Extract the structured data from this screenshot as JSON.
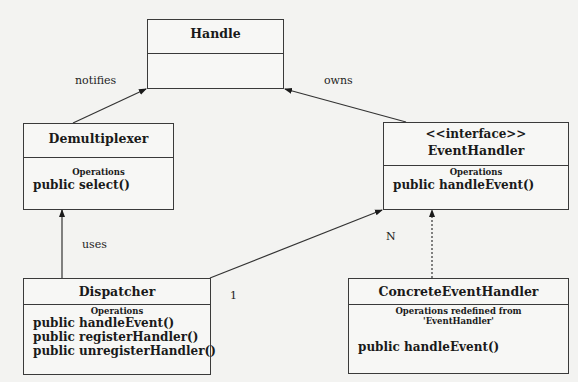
{
  "diagram": {
    "type": "UML class diagram",
    "classes": {
      "handle": {
        "name": "Handle"
      },
      "demultiplexer": {
        "name": "Demultiplexer",
        "ops_header": "Operations",
        "operations": [
          "public select()"
        ]
      },
      "event_handler": {
        "stereotype": "<<interface>>",
        "name": "EventHandler",
        "ops_header": "Operations",
        "operations": [
          "public handleEvent()"
        ]
      },
      "dispatcher": {
        "name": "Dispatcher",
        "ops_header": "Operations",
        "operations": [
          "public handleEvent()",
          "public registerHandler()",
          "public unregisterHandler()"
        ]
      },
      "concrete_event_handler": {
        "name": "ConcreteEventHandler",
        "ops_header_line1": "Operations redefined from",
        "ops_header_line2": "'EventHandler'",
        "operations": [
          "public handleEvent()"
        ]
      }
    },
    "relationships": [
      {
        "from": "Demultiplexer",
        "to": "Handle",
        "label": "notifies",
        "style": "solid-arrow"
      },
      {
        "from": "EventHandler",
        "to": "Handle",
        "label": "owns",
        "style": "solid-arrow"
      },
      {
        "from": "Dispatcher",
        "to": "Demultiplexer",
        "label": "uses",
        "style": "solid-arrow"
      },
      {
        "from": "Dispatcher",
        "to": "EventHandler",
        "label_from": "1",
        "label_to": "N",
        "style": "solid-arrow"
      },
      {
        "from": "ConcreteEventHandler",
        "to": "EventHandler",
        "style": "dotted-arrow"
      }
    ],
    "labels": {
      "notifies": "notifies",
      "owns": "owns",
      "uses": "uses",
      "mult_n": "N",
      "mult_1": "1"
    }
  }
}
